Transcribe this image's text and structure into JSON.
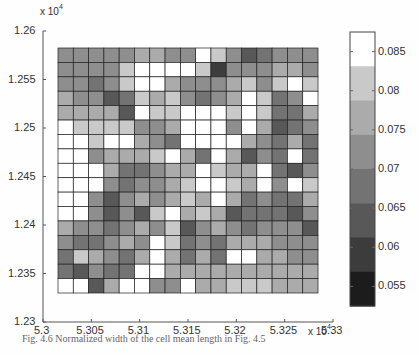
{
  "chart_data": {
    "type": "heatmap",
    "title": "",
    "xlabel": "",
    "ylabel": "",
    "x_multiplier": "x 10^4",
    "y_multiplier": "x 10^4",
    "xlim": [
      5.3,
      5.33
    ],
    "ylim": [
      1.23,
      1.26
    ],
    "x_ticks": [
      "5.3",
      "5.305",
      "5.31",
      "5.315",
      "5.32",
      "5.325",
      "5.33"
    ],
    "y_ticks": [
      "1.23",
      "1.235",
      "1.24",
      "1.245",
      "1.25",
      "1.255",
      "1.26"
    ],
    "grid_cols": 17,
    "grid_rows": 17,
    "x_extent": [
      5.3014,
      5.3286
    ],
    "y_extent": [
      1.2316,
      1.2588
    ],
    "colorbar": {
      "ticks": [
        "0.055",
        "0.06",
        "0.065",
        "0.07",
        "0.075",
        "0.08",
        "0.085"
      ],
      "range": [
        0.0525,
        0.0875
      ],
      "levels": 8,
      "colors": [
        "#1c1c1c",
        "#3c3c3c",
        "#585858",
        "#737373",
        "#8e8e8e",
        "#ababab",
        "#c9c9c9",
        "#ffffff"
      ]
    },
    "value_note": "values are colorbar level indices 0-7 (0 = darkest ≈0.055, 7 = white ≈0.0875); rows listed top (y high) to bottom",
    "values": [
      [
        4,
        4,
        4,
        4,
        4,
        5,
        5,
        4,
        4,
        7,
        6,
        4,
        2,
        3,
        4,
        4,
        4
      ],
      [
        4,
        4,
        4,
        4,
        6,
        7,
        7,
        7,
        7,
        6,
        1,
        4,
        4,
        4,
        5,
        5,
        4
      ],
      [
        4,
        4,
        3,
        4,
        6,
        7,
        7,
        5,
        4,
        4,
        4,
        5,
        6,
        4,
        6,
        7,
        6
      ],
      [
        5,
        4,
        4,
        2,
        3,
        6,
        5,
        6,
        4,
        3,
        4,
        5,
        7,
        6,
        3,
        4,
        7
      ],
      [
        5,
        5,
        5,
        5,
        2,
        7,
        6,
        6,
        7,
        7,
        7,
        6,
        7,
        6,
        3,
        3,
        5
      ],
      [
        7,
        6,
        6,
        6,
        6,
        4,
        4,
        5,
        7,
        7,
        7,
        4,
        7,
        5,
        2,
        3,
        4
      ],
      [
        7,
        7,
        6,
        7,
        7,
        5,
        4,
        3,
        7,
        7,
        7,
        7,
        5,
        4,
        3,
        5,
        3
      ],
      [
        7,
        7,
        4,
        5,
        5,
        5,
        6,
        7,
        5,
        3,
        7,
        5,
        2,
        4,
        3,
        7,
        3
      ],
      [
        7,
        7,
        7,
        5,
        3,
        3,
        4,
        5,
        5,
        7,
        6,
        5,
        5,
        7,
        3,
        2,
        4
      ],
      [
        7,
        7,
        7,
        4,
        3,
        4,
        4,
        5,
        6,
        7,
        7,
        6,
        5,
        7,
        4,
        7,
        6
      ],
      [
        7,
        7,
        4,
        2,
        4,
        5,
        4,
        5,
        6,
        5,
        7,
        5,
        3,
        4,
        3,
        3,
        5
      ],
      [
        7,
        7,
        4,
        2,
        4,
        2,
        6,
        7,
        5,
        6,
        5,
        2,
        3,
        3,
        3,
        2,
        4
      ],
      [
        5,
        4,
        4,
        3,
        4,
        5,
        4,
        6,
        2,
        4,
        5,
        4,
        3,
        4,
        4,
        4,
        2
      ],
      [
        4,
        3,
        3,
        4,
        5,
        4,
        7,
        6,
        3,
        4,
        3,
        5,
        5,
        5,
        4,
        4,
        4
      ],
      [
        3,
        6,
        5,
        4,
        3,
        5,
        7,
        5,
        3,
        5,
        3,
        7,
        7,
        5,
        5,
        4,
        4
      ],
      [
        3,
        2,
        4,
        3,
        3,
        7,
        7,
        5,
        5,
        5,
        5,
        5,
        5,
        5,
        5,
        5,
        5
      ],
      [
        7,
        7,
        2,
        5,
        7,
        7,
        4,
        4,
        7,
        5,
        5,
        6,
        6,
        6,
        5,
        5,
        5
      ]
    ]
  },
  "caption": "Fig. 4.6 Normalized width of the cell mean length in Fig. 4.5"
}
